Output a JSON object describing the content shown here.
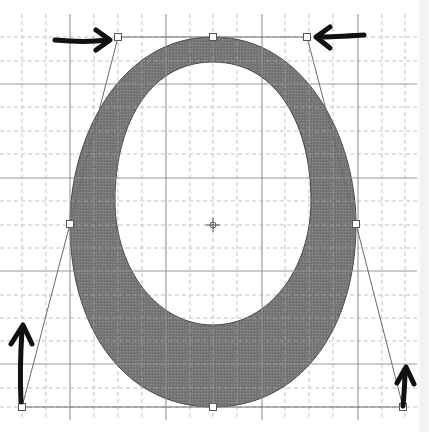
{
  "canvas": {
    "width": 429,
    "height": 432,
    "background": "#ffffff"
  },
  "colors": {
    "fill": "#7a7a7a",
    "fill_texture": "#8c8c8c",
    "outline": "#4a4a4a",
    "major_grid": "#8a8a8a",
    "minor_grid": "#c4c4c4",
    "handle_line": "#6a6a6a",
    "handle_fill": "#ffffff",
    "arrow": "#111111"
  },
  "grid": {
    "x_start": 0,
    "x_end": 420,
    "y_start": 14,
    "y_end": 420,
    "minor_step": 23.7,
    "major_x": [
      70,
      166,
      262,
      358
    ],
    "major_y": [
      84,
      178,
      271,
      364
    ],
    "minor_x": [
      22,
      46,
      94,
      118,
      142,
      190,
      213,
      237,
      285,
      309,
      333,
      382,
      405
    ],
    "minor_y": [
      37,
      61,
      107,
      131,
      154,
      201,
      225,
      248,
      295,
      318,
      341,
      388,
      407
    ]
  },
  "glyph": {
    "label": "O",
    "center": {
      "x": 213,
      "y": 225
    },
    "outer_path": "M213,37 C307,37 356,140 356,224 C356,330 300,407 213,407 C126,407 70,330 70,224 C70,140 118,37 213,37 Z",
    "inner_path": "M213,62 C280,62 311,130 311,200 C311,270 268,325 213,325 C158,325 115,270 115,200 C115,130 146,62 213,62 Z"
  },
  "control_points": [
    {
      "name": "top-left-handle",
      "x": 118,
      "y": 37
    },
    {
      "name": "top-anchor",
      "x": 213,
      "y": 37
    },
    {
      "name": "top-right-handle",
      "x": 307,
      "y": 37
    },
    {
      "name": "left-anchor",
      "x": 70,
      "y": 224
    },
    {
      "name": "right-anchor",
      "x": 356,
      "y": 224
    },
    {
      "name": "bottom-left-handle",
      "x": 22,
      "y": 407
    },
    {
      "name": "bottom-anchor",
      "x": 213,
      "y": 407
    },
    {
      "name": "bottom-right-handle",
      "x": 403,
      "y": 407
    }
  ],
  "handle_lines": [
    {
      "name": "top-handle-line",
      "x1": 118,
      "y1": 37,
      "x2": 307,
      "y2": 37
    },
    {
      "name": "left-upper-handle-line",
      "x1": 118,
      "y1": 37,
      "x2": 70,
      "y2": 224
    },
    {
      "name": "left-lower-handle-line",
      "x1": 70,
      "y1": 224,
      "x2": 22,
      "y2": 407
    },
    {
      "name": "right-upper-handle-line",
      "x1": 307,
      "y1": 37,
      "x2": 356,
      "y2": 224
    },
    {
      "name": "right-lower-handle-line",
      "x1": 356,
      "y1": 224,
      "x2": 403,
      "y2": 407
    },
    {
      "name": "bottom-handle-line",
      "x1": 22,
      "y1": 407,
      "x2": 403,
      "y2": 407
    }
  ],
  "annotation_arrows": [
    {
      "name": "arrow-pointing-right-to-top-left-handle",
      "path": "M55,40 C75,42 92,42 108,40",
      "head": "M96,30 L110,40 L96,50"
    },
    {
      "name": "arrow-pointing-left-to-top-right-handle",
      "path": "M364,35 C348,36 332,37 318,37",
      "head": "M330,27 L316,37 L330,48"
    },
    {
      "name": "arrow-pointing-up-to-bottom-left-handle",
      "path": "M21,402 C20,380 20,360 22,330",
      "head": "M11,344 L23,325 L32,344"
    },
    {
      "name": "arrow-pointing-up-to-bottom-right-handle",
      "path": "M403,406 C404,395 405,384 405,370",
      "head": "M397,383 L406,367 L414,384"
    }
  ]
}
